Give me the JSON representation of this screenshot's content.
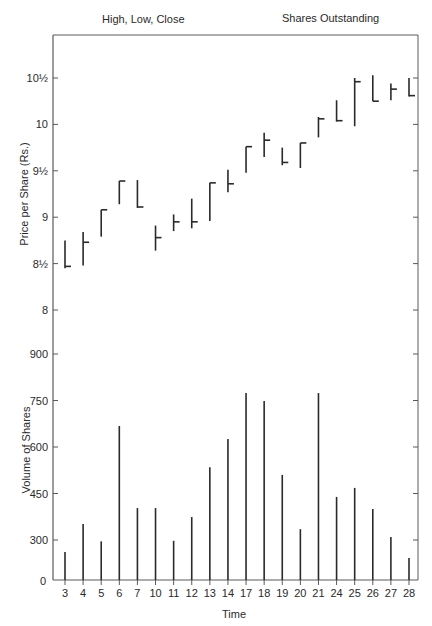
{
  "header": {
    "left_title": "High, Low, Close",
    "right_title": "Shares Outstanding"
  },
  "axes": {
    "price_ylabel": "Price per Share (Rs.)",
    "volume_ylabel": "Volume of Shares",
    "xlabel": "Time"
  },
  "colors": {
    "line": "#2a2a2a",
    "axis": "#5a5a5a",
    "background": "#ffffff"
  },
  "chart_data": [
    {
      "type": "ohlc",
      "title": "High, Low, Close",
      "xlabel": "Time",
      "ylabel": "Price per Share (Rs.)",
      "ytick_labels": [
        "8",
        "8½",
        "9",
        "9½",
        "10",
        "10½"
      ],
      "yticks": [
        8,
        8.5,
        9,
        9.5,
        10,
        10.5
      ],
      "ylim": [
        7.45,
        11.0
      ],
      "categories": [
        "3",
        "4",
        "5",
        "6",
        "7",
        "10",
        "11",
        "12",
        "13",
        "14",
        "17",
        "18",
        "19",
        "20",
        "21",
        "24",
        "25",
        "26",
        "27",
        "28"
      ],
      "series": [
        {
          "name": "High",
          "values": [
            8.75,
            8.84,
            9.08,
            9.39,
            9.4,
            8.91,
            9.03,
            9.2,
            9.37,
            9.51,
            9.76,
            9.91,
            9.75,
            9.8,
            10.08,
            10.26,
            10.5,
            10.53,
            10.44,
            10.5
          ]
        },
        {
          "name": "Low",
          "values": [
            8.45,
            8.48,
            8.79,
            9.14,
            9.1,
            8.64,
            8.85,
            8.88,
            8.96,
            9.27,
            9.48,
            9.65,
            9.56,
            9.53,
            9.86,
            10.03,
            9.98,
            10.25,
            10.26,
            10.3
          ]
        },
        {
          "name": "Close",
          "values": [
            8.47,
            8.73,
            9.08,
            9.39,
            9.11,
            8.78,
            8.95,
            8.95,
            9.37,
            9.36,
            9.76,
            9.83,
            9.59,
            9.8,
            10.06,
            10.04,
            10.46,
            10.25,
            10.38,
            10.31
          ]
        }
      ],
      "grid": false
    },
    {
      "type": "bar",
      "title": "Shares Outstanding",
      "xlabel": "Time",
      "ylabel": "Volume of Shares",
      "ytick_labels": [
        "0",
        "300",
        "450",
        "600",
        "750",
        "900"
      ],
      "yticks": [
        0,
        300,
        450,
        600,
        750,
        900
      ],
      "categories": [
        "3",
        "4",
        "5",
        "6",
        "7",
        "10",
        "11",
        "12",
        "13",
        "14",
        "17",
        "18",
        "19",
        "20",
        "21",
        "24",
        "25",
        "26",
        "27",
        "28"
      ],
      "values": [
        210,
        352,
        290,
        668,
        403,
        403,
        294,
        374,
        535,
        626,
        774,
        748,
        510,
        335,
        774,
        439,
        468,
        400,
        310,
        165
      ],
      "grid": false
    }
  ]
}
